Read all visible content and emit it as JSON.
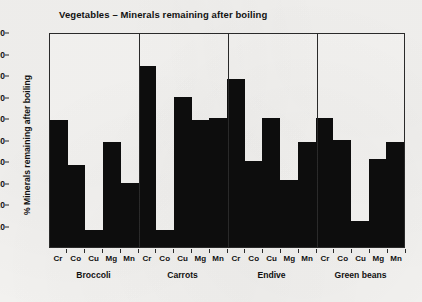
{
  "chart_data": {
    "type": "bar",
    "title": "Vegetables – Minerals remaining after boiling",
    "xlabel": "",
    "ylabel": "% Minerals remaining after boiling",
    "ylim": [
      0,
      100
    ],
    "yticks": [
      10,
      20,
      30,
      40,
      50,
      60,
      70,
      80,
      90,
      100
    ],
    "grid": false,
    "legend": "none",
    "bar_color": "#0d0d0d",
    "categories": [
      "Cr",
      "Co",
      "Cu",
      "Mg",
      "Mn"
    ],
    "groups": [
      {
        "name": "Broccoli",
        "minerals": [
          "Cr",
          "Co",
          "Cu",
          "Mg",
          "Mn"
        ],
        "values": [
          59,
          38,
          8,
          49,
          30
        ]
      },
      {
        "name": "Carrots",
        "minerals": [
          "Cr",
          "Co",
          "Cu",
          "Mg",
          "Mn"
        ],
        "values": [
          84,
          8,
          70,
          59,
          60
        ]
      },
      {
        "name": "Endive",
        "minerals": [
          "Cr",
          "Co",
          "Cu",
          "Mg",
          "Mn"
        ],
        "values": [
          78,
          40,
          60,
          31,
          49
        ]
      },
      {
        "name": "Green beans",
        "minerals": [
          "Cr",
          "Co",
          "Cu",
          "Mg",
          "Mn"
        ],
        "values": [
          60,
          50,
          12,
          41,
          49
        ]
      }
    ]
  }
}
